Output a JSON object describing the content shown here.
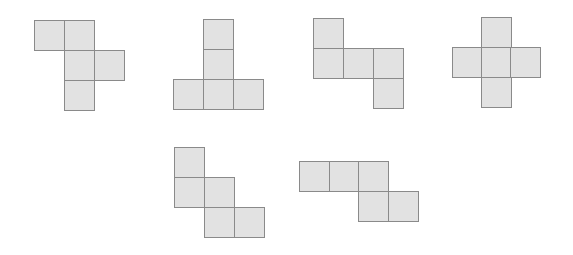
{
  "diagram": {
    "cell_size": 30,
    "fill_color": "#e2e2e2",
    "stroke_color": "#8a8a8a",
    "shapes": [
      {
        "id": "net-1",
        "squares": [
          [
            34,
            20
          ],
          [
            64,
            20
          ],
          [
            64,
            50
          ],
          [
            94,
            50
          ],
          [
            64,
            80
          ]
        ]
      },
      {
        "id": "net-2",
        "squares": [
          [
            203,
            19
          ],
          [
            203,
            49
          ],
          [
            173,
            79
          ],
          [
            203,
            79
          ],
          [
            233,
            79
          ]
        ]
      },
      {
        "id": "net-3",
        "squares": [
          [
            313,
            18
          ],
          [
            313,
            48
          ],
          [
            343,
            48
          ],
          [
            373,
            48
          ],
          [
            373,
            78
          ]
        ]
      },
      {
        "id": "net-4",
        "squares": [
          [
            481,
            17
          ],
          [
            452,
            47
          ],
          [
            481,
            47
          ],
          [
            510,
            47
          ],
          [
            481,
            77
          ]
        ]
      },
      {
        "id": "net-5",
        "squares": [
          [
            174,
            147
          ],
          [
            174,
            177
          ],
          [
            204,
            177
          ],
          [
            204,
            207
          ],
          [
            234,
            207
          ]
        ]
      },
      {
        "id": "net-6",
        "squares": [
          [
            299,
            161
          ],
          [
            329,
            161
          ],
          [
            358,
            161
          ],
          [
            358,
            191
          ],
          [
            388,
            191
          ]
        ]
      }
    ]
  }
}
